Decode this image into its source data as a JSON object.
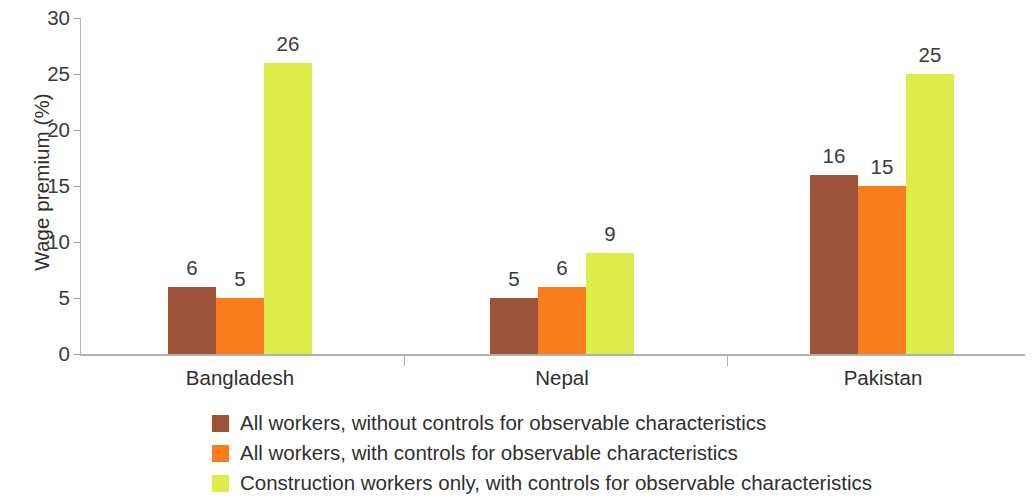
{
  "chart_data": {
    "type": "bar",
    "title": "",
    "xlabel": "",
    "ylabel": "Wage premium (%)",
    "ylim": [
      0,
      30
    ],
    "yticks": [
      "0",
      "5",
      "10",
      "15",
      "20",
      "25",
      "30"
    ],
    "grid": false,
    "legend_position": "bottom-left",
    "categories": [
      "Bangladesh",
      "Nepal",
      "Pakistan"
    ],
    "series": [
      {
        "name": "All workers, without controls for observable characteristics",
        "color": "#9d5239",
        "values": [
          6,
          5,
          16
        ]
      },
      {
        "name": "All workers, with controls for observable characteristics",
        "color": "#f97c1d",
        "values": [
          5,
          6,
          15
        ]
      },
      {
        "name": "Construction workers only, with controls for observable characteristics",
        "color": "#dced4b",
        "values": [
          26,
          9,
          25
        ]
      }
    ],
    "value_labels": {
      "bangladesh": [
        "6",
        "5",
        "26"
      ],
      "nepal": [
        "2",
        "6",
        "9"
      ],
      "pakistan": [
        "16",
        "15",
        "25"
      ]
    }
  }
}
